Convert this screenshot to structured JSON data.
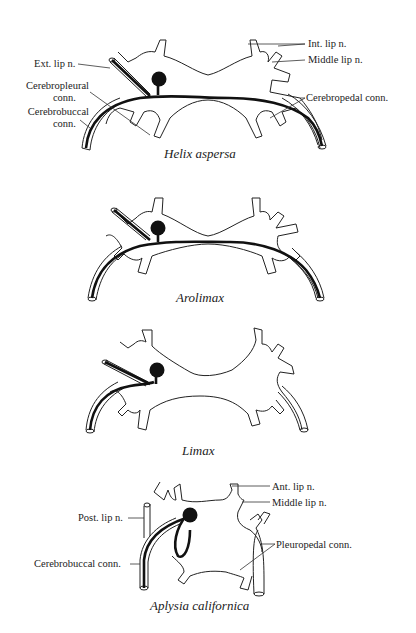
{
  "figure": {
    "panels": [
      {
        "species": "Helix aspersa",
        "labels": {
          "ext_lip": "Ext. lip n.",
          "cerebropleural_1": "Cerebropleural",
          "cerebropleural_2": "conn.",
          "cerebrobuccal_1": "Cerebrobuccal",
          "cerebrobuccal_2": "conn.",
          "int_lip": "Int. lip n.",
          "middle_lip": "Middle lip n.",
          "cerebropedal": "Cerebropedal conn."
        }
      },
      {
        "species": "Arolimax",
        "labels": {}
      },
      {
        "species": "Limax",
        "labels": {}
      },
      {
        "species": "Aplysia californica",
        "labels": {
          "post_lip": "Post. lip n.",
          "cerebrobuccal": "Cerebrobuccal conn.",
          "ant_lip": "Ant. lip n.",
          "middle_lip": "Middle lip n.",
          "pleuropedal": "Pleuropedal conn."
        }
      }
    ],
    "colors": {
      "ink": "#1a1a1a",
      "background": "#ffffff"
    }
  }
}
